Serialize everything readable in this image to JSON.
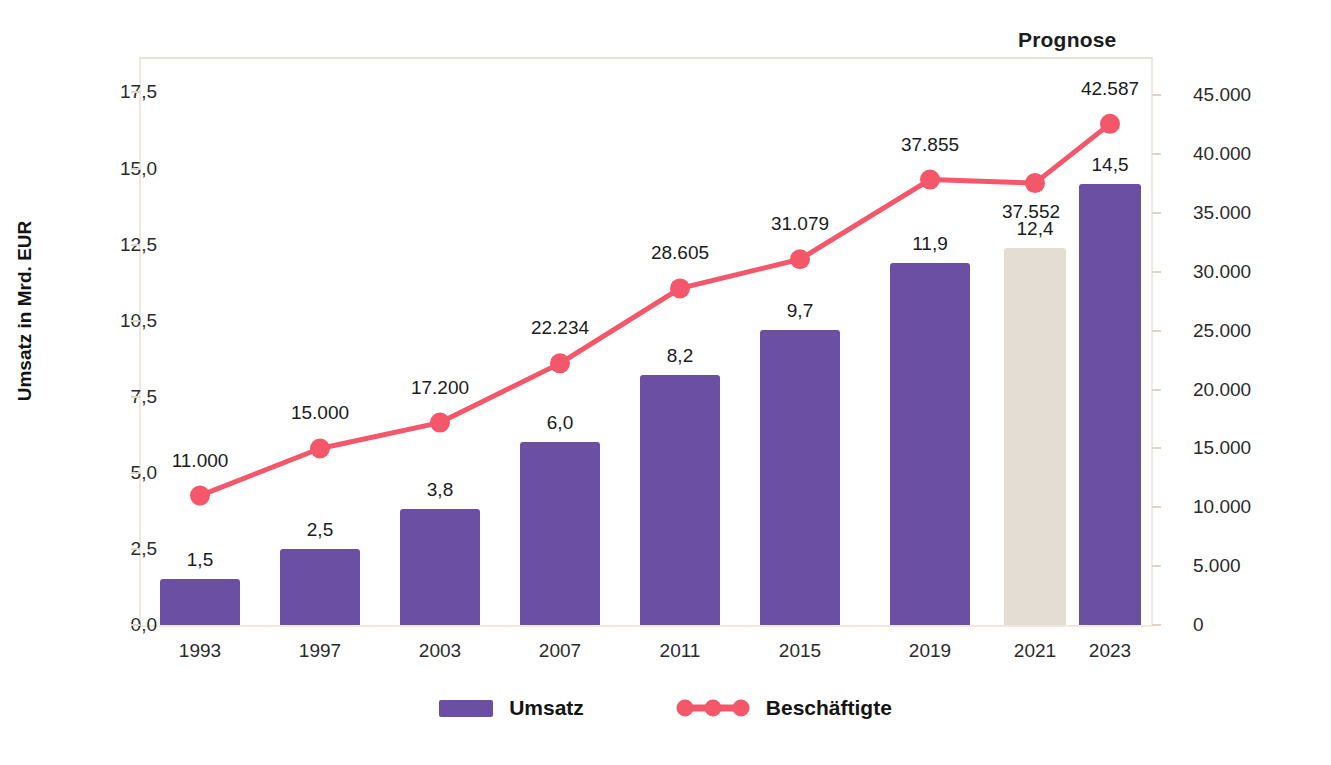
{
  "annotation": {
    "prognose": "Prognose"
  },
  "legend": {
    "items": [
      {
        "label": "Umsatz",
        "type": "bar",
        "color": "#6b4fa3"
      },
      {
        "label": "Beschäftigte",
        "type": "line",
        "color": "#f4566a"
      }
    ]
  },
  "colors": {
    "bar": "#6b4fa3",
    "bar_forecast": "#e4ddd3",
    "line": "#f4566a",
    "frame": "#efe9e1",
    "text": "#1b1b1b"
  },
  "chart_data": {
    "type": "bar",
    "title": "",
    "subtitle": "",
    "categories": [
      "1993",
      "1997",
      "2003",
      "2007",
      "2011",
      "2015",
      "2019",
      "2021",
      "2023"
    ],
    "xlabel": "",
    "ylabel": "Umsatz in Mrd. EUR",
    "y2label": "Beschäftigte in Personen",
    "ylim": [
      0,
      18.6
    ],
    "y2lim": [
      0,
      48100
    ],
    "grid": false,
    "legend_position": "bottom",
    "yticks": [
      "0,0",
      "2,5",
      "5,0",
      "7,5",
      "10,5",
      "12,5",
      "15,0",
      "17,5"
    ],
    "ytick_values": [
      0.0,
      2.5,
      5.0,
      7.5,
      10.0,
      12.5,
      15.0,
      17.5
    ],
    "y2ticks": [
      "0",
      "5.000",
      "10.000",
      "15.000",
      "20.000",
      "25.000",
      "30.000",
      "35.000",
      "40.000",
      "45.000"
    ],
    "y2tick_values": [
      0,
      5000,
      10000,
      15000,
      20000,
      25000,
      30000,
      35000,
      40000,
      45000
    ],
    "series": [
      {
        "name": "Umsatz",
        "type": "bar",
        "axis": "left",
        "unit": "Mrd. EUR",
        "values": [
          1.5,
          2.5,
          3.8,
          6.0,
          8.2,
          9.7,
          11.9,
          12.4,
          14.5
        ],
        "labels": [
          "1,5",
          "2,5",
          "3,8",
          "6,0",
          "8,2",
          "9,7",
          "11,9",
          "12,4",
          "14,5"
        ],
        "forecast_index": 7
      },
      {
        "name": "Beschäftigte",
        "type": "line",
        "axis": "right",
        "unit": "Personen",
        "values": [
          11000,
          15000,
          17200,
          22234,
          28605,
          31079,
          37855,
          37552,
          42587
        ],
        "labels": [
          "11.000",
          "15.000",
          "17.200",
          "22.234",
          "28.605",
          "31.079",
          "37.855",
          "37.552",
          "42.587"
        ]
      }
    ]
  }
}
